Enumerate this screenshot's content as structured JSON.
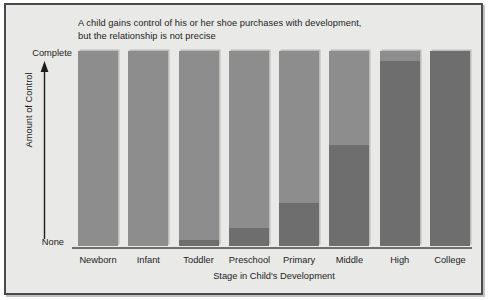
{
  "chart_data": {
    "type": "bar",
    "title": "A child gains control of his or her shoe purchases with development, but the relationship is not precise",
    "title_line1": "A child gains control of his or her shoe purchases with development,",
    "title_line2": "but the relationship is not precise",
    "xlabel": "Stage in Child's Development",
    "ylabel": "Amount of Control",
    "categories": [
      "Newborn",
      "Infant",
      "Toddler",
      "Preschool",
      "Primary",
      "Middle",
      "High",
      "College"
    ],
    "values": [
      0,
      0,
      3,
      9,
      22,
      52,
      95,
      100
    ],
    "ylim": [
      0,
      100
    ],
    "ytick_labels": [
      "None",
      "Complete"
    ],
    "y_axis_min_label": "None",
    "y_axis_max_label": "Complete",
    "grid": false,
    "legend": false,
    "series": [
      {
        "name": "Amount of Control",
        "values": [
          0,
          0,
          3,
          9,
          22,
          52,
          95,
          100
        ]
      }
    ],
    "bars": [
      {
        "category": "Newborn",
        "value": 0,
        "fill_percent": "0%"
      },
      {
        "category": "Infant",
        "value": 0,
        "fill_percent": "0%"
      },
      {
        "category": "Toddler",
        "value": 3,
        "fill_percent": "3%"
      },
      {
        "category": "Preschool",
        "value": 9,
        "fill_percent": "9%"
      },
      {
        "category": "Primary",
        "value": 22,
        "fill_percent": "22%"
      },
      {
        "category": "Middle",
        "value": 52,
        "fill_percent": "52%"
      },
      {
        "category": "High",
        "value": 95,
        "fill_percent": "95%"
      },
      {
        "category": "College",
        "value": 100,
        "fill_percent": "100%"
      }
    ]
  },
  "colors": {
    "bar_background": "#8d8d8d",
    "bar_fill": "#6e6e6e",
    "figure_background": "#e9e9e7",
    "frame_border": "#4a4a4a",
    "axis_line": "#6f6f6f",
    "text": "#1d1d1d"
  }
}
